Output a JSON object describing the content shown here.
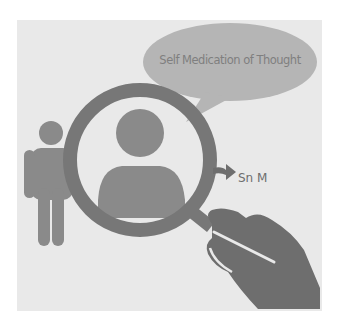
{
  "illustration": {
    "speech_bubble": {
      "text": "Self Medication of Thought"
    },
    "arrow_label": {
      "text": "Sn M"
    },
    "colors": {
      "background": "#e9e9e9",
      "figure": "#8a8a8a",
      "magnifier_ring": "#777777",
      "bubble": "#b5b5b5",
      "hand": "#6e6e6e",
      "text": "#7f7f7f"
    }
  }
}
